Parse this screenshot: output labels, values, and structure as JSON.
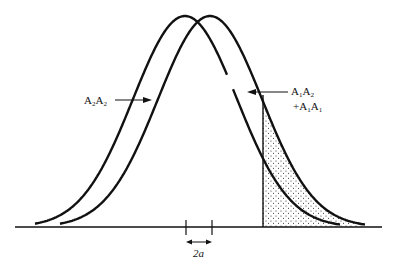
{
  "diagram": {
    "type": "overlapping-normal-distributions",
    "curves": [
      {
        "name": "left-curve",
        "peak_x": 185,
        "peak_y": 16
      },
      {
        "name": "right-curve",
        "peak_x": 210,
        "peak_y": 16
      }
    ],
    "shaded_region": {
      "description": "stippled area right of threshold under right curve",
      "threshold_x": 263
    },
    "labels": {
      "left": {
        "base1": "A",
        "sub1": "2",
        "base2": "A",
        "sub2": "2"
      },
      "right_line1": {
        "base1": "A",
        "sub1": "1",
        "base2": "A",
        "sub2": "2"
      },
      "right_line2": {
        "prefix": "+",
        "base1": "A",
        "sub1": "1",
        "base2": "A",
        "sub2": "1"
      },
      "offset": "2a"
    },
    "colors": {
      "ink": "#111111",
      "background": "#ffffff"
    }
  }
}
